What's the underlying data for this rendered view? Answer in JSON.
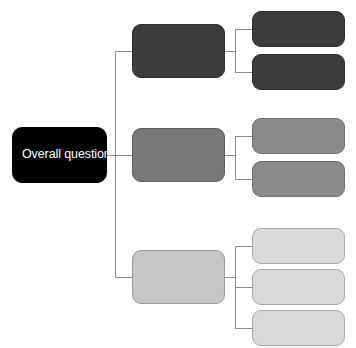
{
  "diagram": {
    "type": "hierarchy-tree",
    "title_text": "",
    "background_color": "#ffffff",
    "connector_color": "#8c8c8c",
    "connector_width": 1,
    "root": {
      "id": "root",
      "label": "Overall question",
      "fill_color": "#000000",
      "text_color": "#ffffff",
      "border_color": "#000000",
      "x": 12,
      "y": 127,
      "width": 95,
      "height": 56
    },
    "branches": [
      {
        "id": "branch-1",
        "label": "",
        "fill_color": "#3c3c3c",
        "border_color": "#2d2d2d",
        "text_color": "#ffffff",
        "x": 132,
        "y": 24,
        "width": 93,
        "height": 54,
        "children": [
          {
            "id": "branch-1-leaf-1",
            "label": "",
            "fill_color": "#3c3c3c",
            "border_color": "#2d2d2d",
            "text_color": "#ffffff",
            "x": 252,
            "y": 11,
            "width": 93,
            "height": 36
          },
          {
            "id": "branch-1-leaf-2",
            "label": "",
            "fill_color": "#3c3c3c",
            "border_color": "#2d2d2d",
            "text_color": "#ffffff",
            "x": 252,
            "y": 54,
            "width": 93,
            "height": 36
          }
        ]
      },
      {
        "id": "branch-2",
        "label": "",
        "fill_color": "#787878",
        "border_color": "#5f5f5f",
        "text_color": "#ffffff",
        "x": 132,
        "y": 128,
        "width": 93,
        "height": 54,
        "children": [
          {
            "id": "branch-2-leaf-1",
            "label": "",
            "fill_color": "#8a8a8a",
            "border_color": "#6e6e6e",
            "text_color": "#ffffff",
            "x": 252,
            "y": 118,
            "width": 93,
            "height": 36
          },
          {
            "id": "branch-2-leaf-2",
            "label": "",
            "fill_color": "#8a8a8a",
            "border_color": "#6e6e6e",
            "text_color": "#ffffff",
            "x": 252,
            "y": 161,
            "width": 93,
            "height": 36
          }
        ]
      },
      {
        "id": "branch-3",
        "label": "",
        "fill_color": "#c6c6c6",
        "border_color": "#9a9a9a",
        "text_color": "#000000",
        "x": 132,
        "y": 250,
        "width": 93,
        "height": 54,
        "children": [
          {
            "id": "branch-3-leaf-1",
            "label": "",
            "fill_color": "#d9d9d9",
            "border_color": "#a8a8a8",
            "text_color": "#000000",
            "x": 252,
            "y": 228,
            "width": 93,
            "height": 36
          },
          {
            "id": "branch-3-leaf-2",
            "label": "",
            "fill_color": "#d9d9d9",
            "border_color": "#a8a8a8",
            "text_color": "#000000",
            "x": 252,
            "y": 269,
            "width": 93,
            "height": 36
          },
          {
            "id": "branch-3-leaf-3",
            "label": "",
            "fill_color": "#d9d9d9",
            "border_color": "#a8a8a8",
            "text_color": "#000000",
            "x": 252,
            "y": 310,
            "width": 93,
            "height": 36
          }
        ]
      }
    ]
  }
}
